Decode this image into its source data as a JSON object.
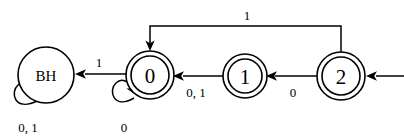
{
  "diagram": {
    "type": "state-machine",
    "background_color": "#ffffff",
    "stroke_color": "#000000",
    "states": [
      {
        "id": "BH",
        "label": "BH",
        "accepting": false,
        "start": false,
        "cx": 46,
        "cy": 75,
        "r_outer": 28,
        "r_inner": 22
      },
      {
        "id": "S0",
        "label": "0",
        "accepting": true,
        "start": false,
        "cx": 150,
        "cy": 75,
        "r_outer": 24,
        "r_inner": 19
      },
      {
        "id": "S1",
        "label": "1",
        "accepting": true,
        "start": false,
        "cx": 245,
        "cy": 76,
        "r_outer": 22,
        "r_inner": 17
      },
      {
        "id": "S2",
        "label": "2",
        "accepting": true,
        "start": true,
        "cx": 341,
        "cy": 76,
        "r_outer": 24,
        "r_inner": 19
      }
    ],
    "transitions": [
      {
        "id": "t-s0-bh",
        "from": "S0",
        "to": "BH",
        "label": "1",
        "label_x": 99,
        "label_y": 62,
        "kind": "straight-horizontal"
      },
      {
        "id": "t-s1-s0",
        "from": "S1",
        "to": "S0",
        "label": "0, 1",
        "label_x": 196,
        "label_y": 92,
        "kind": "straight-horizontal"
      },
      {
        "id": "t-s2-s1",
        "from": "S2",
        "to": "S1",
        "label": "0",
        "label_x": 293,
        "label_y": 92,
        "kind": "straight-horizontal"
      },
      {
        "id": "t-s2-s0-feedback",
        "from": "S2",
        "to": "S0",
        "label": "1",
        "label_x": 247,
        "label_y": 15,
        "kind": "orthogonal-top-route"
      },
      {
        "id": "t-bh-bh-loop",
        "from": "BH",
        "to": "BH",
        "label": "0, 1",
        "label_x": 28,
        "label_y": 127,
        "kind": "self-loop-lower-left"
      },
      {
        "id": "t-s0-s0-loop",
        "from": "S0",
        "to": "S0",
        "label": "0",
        "label_x": 124,
        "label_y": 127,
        "kind": "self-loop-lower-left"
      }
    ],
    "start_arrow": {
      "id": "start-arrow",
      "target": "S2",
      "from_x": 404,
      "to_x": 368,
      "y": 76
    },
    "alphabet": [
      "0",
      "1"
    ],
    "start_state": "S2",
    "accepting_states": [
      "0",
      "1",
      "2"
    ],
    "trap_state": "BH"
  }
}
